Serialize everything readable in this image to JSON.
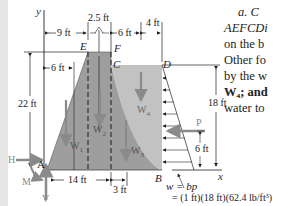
{
  "figure": {
    "axes": {
      "y_label": "y",
      "x_label": "x"
    },
    "points": {
      "A": "A",
      "B": "B",
      "C": "C",
      "D": "D",
      "E": "E",
      "F": "F"
    },
    "dimensions": {
      "top_9": "9 ft",
      "top_25": "2.5 ft",
      "top_6": "6 ft",
      "top_4": "4 ft",
      "inner_6": "6 ft",
      "height_22": "22 ft",
      "height_18": "18 ft",
      "p_height_6": "6 ft",
      "base_14": "14 ft",
      "base_3": "3 ft"
    },
    "weights": {
      "w1": "W",
      "w1_sub": "1",
      "w2": "W",
      "w2_sub": "2",
      "w3": "W",
      "w3_sub": "3",
      "w4": "W",
      "w4_sub": "4"
    },
    "forces": {
      "P": "P",
      "H": "H",
      "V": "V",
      "M": "M"
    },
    "load_eq": {
      "line1": "w = bp",
      "line2": "= (1 ft)(18 ft)(62.4 lb/ft³)"
    },
    "colors": {
      "dam_fill": "#9e9e9e",
      "water_fill": "#c2c2c2",
      "arrow_gray": "#8a8a8a"
    }
  },
  "side_text": {
    "lines": [
      "a. C",
      "AEFCDi",
      "on the b",
      "Other fo",
      "by the w",
      "W₄; and",
      "water to"
    ]
  }
}
